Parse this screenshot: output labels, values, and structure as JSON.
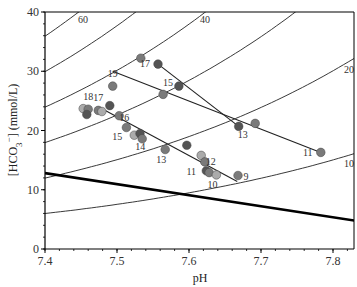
{
  "chart_data": {
    "type": "scatter",
    "title": "",
    "xlabel": "pH",
    "ylabel": "[HCO3⁻] (mmol/L)",
    "ylabel_parts": {
      "open": "[HCO",
      "sub": "3",
      "sup": "−",
      "close": "] (mmol/L)"
    },
    "xlim": [
      7.4,
      7.83
    ],
    "ylim": [
      0,
      40
    ],
    "x_ticks": [
      "7.4",
      "7.5",
      "7.6",
      "7.7",
      "7.8"
    ],
    "y_ticks": [
      "0",
      "10",
      "20",
      "30",
      "40"
    ],
    "grid": false,
    "isobars": {
      "description": "PCO2 isopleths (mmHg): HCO3 = 0.03 * PCO2 * 10^(pH - 6.1)",
      "values": [
        60,
        50,
        40,
        30,
        20,
        10
      ],
      "labels": [
        {
          "pco2": 60,
          "text": "60"
        },
        {
          "pco2": 40,
          "text": "40"
        },
        {
          "pco2": 20,
          "text": "20"
        },
        {
          "pco2": 10,
          "text": "10"
        }
      ]
    },
    "threshold_line": {
      "start": [
        7.4,
        12.8
      ],
      "end": [
        7.83,
        4.8
      ]
    },
    "trajectories": [
      {
        "start": [
          7.494,
          30.0
        ],
        "end": [
          7.783,
          16.3
        ]
      },
      {
        "start": [
          7.557,
          31.2
        ],
        "end": [
          7.669,
          20.7
        ]
      },
      {
        "start": [
          7.476,
          23.9
        ],
        "end": [
          7.667,
          11.4
        ]
      }
    ],
    "points": [
      {
        "pH": 7.533,
        "hco3": 32.2,
        "shade": "mid",
        "label": ""
      },
      {
        "pH": 7.557,
        "hco3": 31.2,
        "shade": "dark",
        "label": "17"
      },
      {
        "pH": 7.586,
        "hco3": 27.5,
        "shade": "dark",
        "label": "15"
      },
      {
        "pH": 7.564,
        "hco3": 26.1,
        "shade": "mid",
        "label": ""
      },
      {
        "pH": 7.669,
        "hco3": 20.7,
        "shade": "dark",
        "label": "13"
      },
      {
        "pH": 7.692,
        "hco3": 21.2,
        "shade": "mid",
        "label": ""
      },
      {
        "pH": 7.783,
        "hco3": 16.3,
        "shade": "mid",
        "label": "11"
      },
      {
        "pH": 7.494,
        "hco3": 27.5,
        "shade": "mid",
        "label": "19"
      },
      {
        "pH": 7.453,
        "hco3": 23.7,
        "shade": "light",
        "label": ""
      },
      {
        "pH": 7.46,
        "hco3": 23.6,
        "shade": "mid",
        "label": "18"
      },
      {
        "pH": 7.458,
        "hco3": 22.7,
        "shade": "dark",
        "label": ""
      },
      {
        "pH": 7.474,
        "hco3": 23.4,
        "shade": "mid",
        "label": "17"
      },
      {
        "pH": 7.479,
        "hco3": 23.2,
        "shade": "light",
        "label": ""
      },
      {
        "pH": 7.49,
        "hco3": 24.2,
        "shade": "dark",
        "label": ""
      },
      {
        "pH": 7.503,
        "hco3": 22.5,
        "shade": "mid",
        "label": "16"
      },
      {
        "pH": 7.513,
        "hco3": 20.5,
        "shade": "mid",
        "label": ""
      },
      {
        "pH": 7.524,
        "hco3": 19.2,
        "shade": "light",
        "label": "15"
      },
      {
        "pH": 7.532,
        "hco3": 19.5,
        "shade": "dark",
        "label": ""
      },
      {
        "pH": 7.535,
        "hco3": 18.6,
        "shade": "mid",
        "label": "14"
      },
      {
        "pH": 7.567,
        "hco3": 16.8,
        "shade": "mid",
        "label": "13"
      },
      {
        "pH": 7.597,
        "hco3": 17.5,
        "shade": "dark",
        "label": ""
      },
      {
        "pH": 7.617,
        "hco3": 15.8,
        "shade": "light",
        "label": ""
      },
      {
        "pH": 7.622,
        "hco3": 14.7,
        "shade": "mid",
        "label": "12"
      },
      {
        "pH": 7.624,
        "hco3": 13.2,
        "shade": "dark",
        "label": "11"
      },
      {
        "pH": 7.628,
        "hco3": 12.9,
        "shade": "mid",
        "label": ""
      },
      {
        "pH": 7.638,
        "hco3": 12.5,
        "shade": "light",
        "label": "10"
      },
      {
        "pH": 7.668,
        "hco3": 12.4,
        "shade": "mid",
        "label": "9"
      }
    ],
    "shade_colors": {
      "dark": "#545454",
      "mid": "#7a7a7a",
      "light": "#ababab"
    },
    "line_color": "#222222"
  }
}
